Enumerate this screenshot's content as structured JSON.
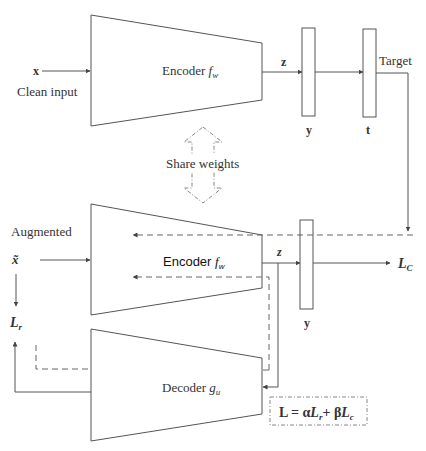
{
  "diagram": {
    "top": {
      "input_symbol": "x",
      "input_label": "Clean input",
      "encoder_label": "Encoder ",
      "encoder_fn": "f",
      "encoder_sub": "w",
      "z_label": "z",
      "y_label": "y",
      "t_label": "t",
      "target_label": "Target"
    },
    "share_weights_label": "Share weights",
    "bottom": {
      "input_label": "Augmented",
      "input_symbol": "x̃",
      "encoder_label": "Encoder ",
      "encoder_fn": "f",
      "encoder_sub": "w",
      "z_label": "z",
      "y_label": "y",
      "lc_label": "L",
      "lc_sub": "C",
      "lr_label": "L",
      "lr_sub": "r",
      "decoder_label": "Decoder ",
      "decoder_fn": "g",
      "decoder_sub": "u"
    },
    "loss_formula": {
      "prefix": "L = α",
      "term1": "L",
      "term1_sub": "r",
      "plus": "+ β",
      "term2": "L",
      "term2_sub": "c"
    }
  }
}
